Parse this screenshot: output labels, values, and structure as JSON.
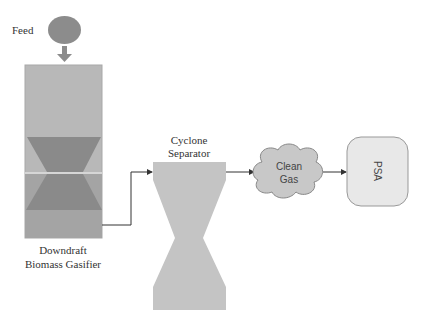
{
  "diagram": {
    "nodes": {
      "feed": {
        "label": "Feed",
        "shape": "ellipse",
        "color": "#8c8c8c"
      },
      "gasifier": {
        "label_line1": "Downdraft",
        "label_line2": "Biomass Gasifier",
        "shape": "column-with-hourglass",
        "body_color": "#b4b4b4",
        "cone_color": "#8a8a8a"
      },
      "cyclone": {
        "label_line1": "Cyclone",
        "label_line2": "Separator",
        "shape": "hourglass",
        "color": "#c4c4c4"
      },
      "clean_gas": {
        "label_line1": "Clean",
        "label_line2": "Gas",
        "shape": "cloud",
        "color": "#c8c8c8"
      },
      "psa": {
        "label": "PSA",
        "shape": "rounded-rect",
        "color": "#e8e8e8"
      }
    },
    "edges": [
      {
        "from": "feed",
        "to": "gasifier"
      },
      {
        "from": "gasifier",
        "to": "cyclone"
      },
      {
        "from": "cyclone",
        "to": "clean_gas"
      },
      {
        "from": "clean_gas",
        "to": "psa"
      }
    ]
  }
}
